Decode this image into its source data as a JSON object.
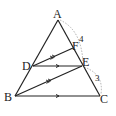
{
  "diagram": {
    "points": {
      "A": {
        "label": "A",
        "x": 58,
        "y": 20
      },
      "B": {
        "label": "B",
        "x": 15,
        "y": 96
      },
      "C": {
        "label": "C",
        "x": 100,
        "y": 96
      },
      "D": {
        "label": "D",
        "x": 33,
        "y": 66
      },
      "E": {
        "label": "E",
        "x": 82,
        "y": 66
      },
      "F": {
        "label": "F",
        "x": 73,
        "y": 47
      }
    },
    "measurements": {
      "AE_arc_label": "4",
      "EC_arc_label": "3"
    },
    "colors": {
      "line": "#222222",
      "arc": "#888888"
    }
  }
}
